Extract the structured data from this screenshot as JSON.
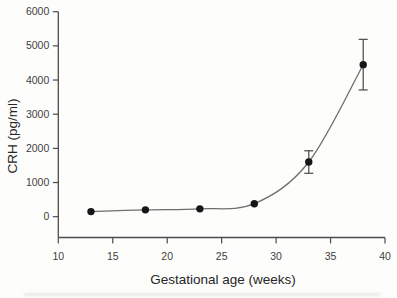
{
  "figure": {
    "colors": {
      "background": "#fdfdfc",
      "axis": "#4c4c4c",
      "curve": "#6f6f6f",
      "marker": "#161616",
      "error_bar": "#555555",
      "tick_text": "#3d3d3d",
      "title_text": "#262626"
    }
  },
  "chart_data": {
    "type": "line",
    "title": "",
    "xlabel": "Gestational age (weeks)",
    "ylabel": "CRH (pg/ml)",
    "x": [
      13,
      18,
      23,
      28,
      33,
      38
    ],
    "y": [
      150,
      200,
      230,
      380,
      1600,
      4450
    ],
    "yerr": [
      0,
      0,
      0,
      0,
      330,
      740
    ],
    "xlim": [
      10,
      40
    ],
    "ylim": [
      0,
      6000
    ],
    "xticks": [
      10,
      15,
      20,
      25,
      30,
      35,
      40
    ],
    "yticks": [
      0,
      1000,
      2000,
      3000,
      4000,
      5000,
      6000
    ],
    "grid": false,
    "legend": "none",
    "marker": "filled-circle",
    "line_style": "smooth-spline",
    "series_name": "Maternal plasma CRH"
  }
}
